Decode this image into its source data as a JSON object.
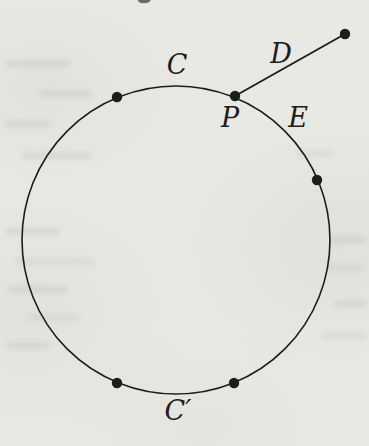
{
  "figure": {
    "ink_color": "#1d1d1b",
    "paper_color": "#e8e8e4",
    "canvas": {
      "width": 369,
      "height": 446
    },
    "circle": {
      "cx": 176,
      "cy": 240,
      "r": 154,
      "stroke_width": 1.6
    },
    "segment": {
      "x1": 235,
      "y1": 96,
      "x2": 345,
      "y2": 34,
      "stroke_width": 1.9
    },
    "point_radius": 5.2,
    "points": [
      {
        "name": "point-on-arc-upper-left",
        "x": 117,
        "y": 97
      },
      {
        "name": "point-P",
        "x": 235,
        "y": 96
      },
      {
        "name": "point-on-arc-right",
        "x": 317,
        "y": 180
      },
      {
        "name": "point-on-arc-lower-left",
        "x": 117,
        "y": 383
      },
      {
        "name": "point-on-arc-lower-right",
        "x": 234,
        "y": 383
      },
      {
        "name": "point-segment-end",
        "x": 345,
        "y": 34
      }
    ],
    "labels": [
      {
        "name": "label-C",
        "text": "C",
        "x": 177,
        "y": 74
      },
      {
        "name": "label-D",
        "text": "D",
        "x": 281,
        "y": 63
      },
      {
        "name": "label-P",
        "text": "P",
        "x": 230,
        "y": 127
      },
      {
        "name": "label-E",
        "text": "E",
        "x": 298,
        "y": 127
      },
      {
        "name": "label-C-prime",
        "text": "C′",
        "x": 178,
        "y": 420
      }
    ]
  }
}
